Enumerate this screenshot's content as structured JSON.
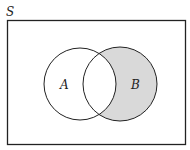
{
  "diagram": {
    "type": "venn",
    "universe_label": "S",
    "sets": [
      {
        "label": "A",
        "shaded": false
      },
      {
        "label": "B",
        "shaded": true
      }
    ],
    "shaded_region": "B minus A",
    "colors": {
      "stroke": "#222222",
      "shade": "#d9d9d9",
      "background": "#ffffff"
    }
  }
}
